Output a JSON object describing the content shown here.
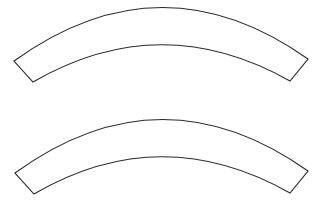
{
  "diagram": {
    "stroke_color": "#2a2a2a",
    "fill_color": "#ffffff",
    "background_color": "#ffffff",
    "shapes": [
      {
        "type": "annular-sector",
        "outer_left": [
          14,
          61
        ],
        "outer_peak": [
          161,
          8
        ],
        "outer_right": [
          308,
          59
        ],
        "inner_left": [
          33,
          82
        ],
        "inner_peak": [
          163,
          44
        ],
        "inner_right": [
          290,
          81
        ]
      },
      {
        "type": "annular-sector",
        "outer_left": [
          15,
          173
        ],
        "outer_peak": [
          161,
          120
        ],
        "outer_right": [
          308,
          171
        ],
        "inner_left": [
          34,
          194
        ],
        "inner_peak": [
          163,
          156
        ],
        "inner_right": [
          290,
          193
        ]
      }
    ]
  }
}
